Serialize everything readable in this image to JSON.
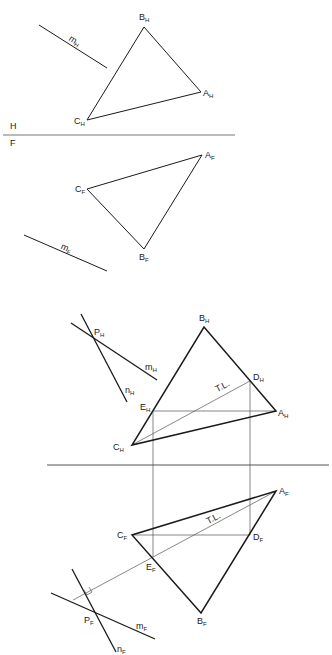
{
  "figure": {
    "colors": {
      "stroke": "#1a1a1a",
      "thin": "#555555",
      "fold": "#777777"
    },
    "panel_top": {
      "fold_line": {
        "x1": 3,
        "y1": 135,
        "x2": 235,
        "y2": 135
      },
      "fold_labels": [
        {
          "text": "H",
          "x": 10,
          "y": 122
        },
        {
          "text": "F",
          "x": 10,
          "y": 139
        }
      ],
      "horizontal_view": {
        "triangle": {
          "A": [
            201,
            92
          ],
          "B": [
            144,
            27
          ],
          "C": [
            87,
            120
          ]
        },
        "line_m": {
          "x1": 39,
          "y1": 25,
          "x2": 107,
          "y2": 68
        },
        "labels": [
          {
            "base": "B",
            "sub": "H",
            "x": 139,
            "y": 13
          },
          {
            "base": "A",
            "sub": "H",
            "x": 203,
            "y": 89
          },
          {
            "base": "C",
            "sub": "H",
            "x": 74,
            "y": 117
          },
          {
            "base": "m",
            "sub": "H",
            "x": 72,
            "y": 34,
            "rotate": 32
          }
        ]
      },
      "frontal_view": {
        "triangle": {
          "A": [
            202,
            155
          ],
          "B": [
            144,
            249
          ],
          "C": [
            87,
            189
          ]
        },
        "line_m": {
          "x1": 24,
          "y1": 235,
          "x2": 107,
          "y2": 271
        },
        "labels": [
          {
            "base": "A",
            "sub": "F",
            "x": 205,
            "y": 151
          },
          {
            "base": "C",
            "sub": "F",
            "x": 75,
            "y": 185
          },
          {
            "base": "B",
            "sub": "F",
            "x": 139,
            "y": 253
          },
          {
            "base": "m",
            "sub": "F",
            "x": 63,
            "y": 242,
            "rotate": 24
          }
        ]
      }
    },
    "panel_bottom": {
      "fold_line": {
        "x1": 47,
        "y1": 465,
        "x2": 329,
        "y2": 465
      },
      "projectors": [
        {
          "x1": 153,
          "y1": 411,
          "x2": 153,
          "y2": 557
        },
        {
          "x1": 250,
          "y1": 381,
          "x2": 250,
          "y2": 535
        }
      ],
      "horizontal_view": {
        "triangle": {
          "A": [
            276,
            411
          ],
          "B": [
            204,
            327
          ],
          "C": [
            132,
            445
          ]
        },
        "line_m": {
          "x1": 71,
          "y1": 323,
          "x2": 157,
          "y2": 380
        },
        "line_n": {
          "x1": 81,
          "y1": 314,
          "x2": 127,
          "y2": 402
        },
        "horizontal_EA": {
          "x1": 154,
          "y1": 411,
          "x2": 276,
          "y2": 411
        },
        "true_length_CD": {
          "x1": 132,
          "y1": 445,
          "x2": 250,
          "y2": 381
        },
        "labels": [
          {
            "base": "B",
            "sub": "H",
            "x": 199,
            "y": 314
          },
          {
            "base": "P",
            "sub": "H",
            "x": 94,
            "y": 328
          },
          {
            "base": "m",
            "sub": "H",
            "x": 145,
            "y": 363
          },
          {
            "base": "n",
            "sub": "H",
            "x": 125,
            "y": 386
          },
          {
            "base": "D",
            "sub": "H",
            "x": 253,
            "y": 373
          },
          {
            "base": "E",
            "sub": "H",
            "x": 140,
            "y": 403
          },
          {
            "base": "A",
            "sub": "H",
            "x": 278,
            "y": 409
          },
          {
            "base": "C",
            "sub": "H",
            "x": 113,
            "y": 443
          },
          {
            "base": "T.L.",
            "sub": "",
            "x": 214,
            "y": 386,
            "rotate": -28
          }
        ]
      },
      "frontal_view": {
        "triangle": {
          "A": [
            276,
            491
          ],
          "B": [
            201,
            613
          ],
          "C": [
            132,
            535
          ]
        },
        "line_m": {
          "x1": 51,
          "y1": 593,
          "x2": 155,
          "y2": 639
        },
        "line_n": {
          "x1": 72,
          "y1": 569,
          "x2": 116,
          "y2": 652
        },
        "horizontal_CD": {
          "x1": 132,
          "y1": 535,
          "x2": 250,
          "y2": 535
        },
        "true_length_AE": {
          "x1": 276,
          "y1": 491,
          "x2": 73,
          "y2": 600
        },
        "right_angle_marker": "M84,590 L87,595 L92,592 L89,587",
        "labels": [
          {
            "base": "A",
            "sub": "F",
            "x": 279,
            "y": 487
          },
          {
            "base": "T.L.",
            "sub": "",
            "x": 205,
            "y": 518,
            "rotate": -28
          },
          {
            "base": "C",
            "sub": "F",
            "x": 117,
            "y": 531
          },
          {
            "base": "D",
            "sub": "F",
            "x": 253,
            "y": 533
          },
          {
            "base": "E",
            "sub": "F",
            "x": 146,
            "y": 563
          },
          {
            "base": "P",
            "sub": "F",
            "x": 84,
            "y": 616
          },
          {
            "base": "m",
            "sub": "F",
            "x": 136,
            "y": 622
          },
          {
            "base": "B",
            "sub": "F",
            "x": 197,
            "y": 617
          },
          {
            "base": "n",
            "sub": "F",
            "x": 117,
            "y": 645
          }
        ]
      }
    }
  }
}
